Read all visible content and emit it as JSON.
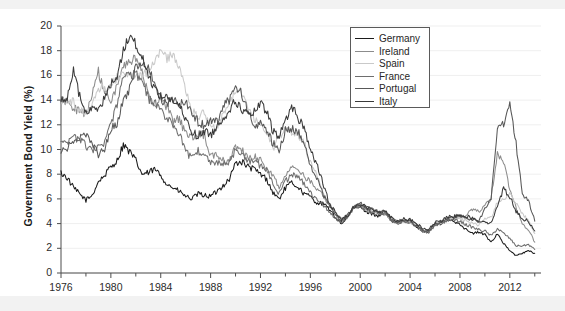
{
  "chart_data": {
    "type": "line",
    "title": "",
    "xlabel": "",
    "ylabel": "Government Bond Yield (%)",
    "xlim": [
      1976,
      2014.5
    ],
    "ylim": [
      0,
      20
    ],
    "ytick_step": 2,
    "xtick_step": 4,
    "xminor_step": 2,
    "grid": "horizontal-faint",
    "legend_position": "top-right-inside",
    "ytick_labels": [
      "0",
      "2",
      "4",
      "6",
      "8",
      "10",
      "12",
      "14",
      "16",
      "18",
      "20"
    ],
    "xtick_labels": [
      "1976",
      "1980",
      "1984",
      "1988",
      "1992",
      "1996",
      "2000",
      "2004",
      "2008",
      "2012"
    ],
    "legend_entries": [
      "Germany",
      "Ireland",
      "Spain",
      "France",
      "Portugal",
      "Italy"
    ],
    "colors": {
      "Germany": "#1b1b1b",
      "Ireland": "#8c8c8c",
      "Spain": "#c9c9c9",
      "France": "#6e6e6e",
      "Portugal": "#585858",
      "Italy": "#3a3a3a"
    },
    "x": [
      1976,
      1976.5,
      1977,
      1977.5,
      1978,
      1978.5,
      1979,
      1979.5,
      1980,
      1980.5,
      1981,
      1981.5,
      1982,
      1982.5,
      1983,
      1983.5,
      1984,
      1984.5,
      1985,
      1985.5,
      1986,
      1986.5,
      1987,
      1987.5,
      1988,
      1988.5,
      1989,
      1989.5,
      1990,
      1990.5,
      1991,
      1991.5,
      1992,
      1992.5,
      1993,
      1993.5,
      1994,
      1994.5,
      1995,
      1995.5,
      1996,
      1996.5,
      1997,
      1997.5,
      1998,
      1998.5,
      1999,
      1999.5,
      2000,
      2000.5,
      2001,
      2001.5,
      2002,
      2002.5,
      2003,
      2003.5,
      2004,
      2004.5,
      2005,
      2005.5,
      2006,
      2006.5,
      2007,
      2007.5,
      2008,
      2008.5,
      2009,
      2009.5,
      2010,
      2010.5,
      2011,
      2011.5,
      2012,
      2012.5,
      2013,
      2013.5,
      2014
    ],
    "series": [
      {
        "name": "Germany",
        "values": [
          8.1,
          7.7,
          6.9,
          6.4,
          5.9,
          6.3,
          7.4,
          7.9,
          8.6,
          9.1,
          10.4,
          9.8,
          9.1,
          8.0,
          8.1,
          8.4,
          7.9,
          7.2,
          6.9,
          6.6,
          6.2,
          6.0,
          6.4,
          6.3,
          6.2,
          6.6,
          7.1,
          7.6,
          8.9,
          9.0,
          8.6,
          8.4,
          8.0,
          7.6,
          6.5,
          6.0,
          6.9,
          7.3,
          7.0,
          6.4,
          6.2,
          5.7,
          5.6,
          5.2,
          4.5,
          4.0,
          4.5,
          5.3,
          5.3,
          5.0,
          4.8,
          4.6,
          4.8,
          4.2,
          4.0,
          4.2,
          4.1,
          3.8,
          3.4,
          3.3,
          3.9,
          4.0,
          4.3,
          4.2,
          4.0,
          3.5,
          3.2,
          3.3,
          3.1,
          2.5,
          3.2,
          2.4,
          1.8,
          1.4,
          1.6,
          1.8,
          1.6
        ]
      },
      {
        "name": "Ireland",
        "values": [
          14.0,
          13.9,
          13.4,
          13.0,
          12.8,
          14.6,
          16.3,
          14.5,
          14.1,
          15.1,
          16.6,
          17.2,
          17.3,
          16.3,
          14.4,
          13.6,
          14.0,
          13.5,
          12.2,
          12.5,
          11.3,
          11.0,
          11.3,
          11.2,
          9.4,
          9.5,
          9.1,
          9.0,
          10.2,
          10.0,
          9.2,
          9.4,
          9.2,
          8.4,
          7.9,
          7.0,
          8.0,
          8.5,
          8.3,
          7.8,
          7.4,
          6.7,
          6.3,
          5.5,
          4.8,
          4.3,
          4.7,
          5.4,
          5.5,
          5.2,
          5.0,
          4.8,
          4.9,
          4.4,
          4.2,
          4.3,
          4.2,
          3.9,
          3.5,
          3.4,
          4.0,
          4.1,
          4.4,
          4.4,
          4.5,
          4.6,
          5.2,
          5.0,
          5.4,
          6.1,
          9.7,
          8.9,
          6.8,
          5.3,
          3.9,
          3.5,
          2.5
        ]
      },
      {
        "name": "Spain",
        "values": [
          13.9,
          14.0,
          13.8,
          13.2,
          13.0,
          13.6,
          14.7,
          15.0,
          15.3,
          15.8,
          16.1,
          16.2,
          16.0,
          15.8,
          16.5,
          17.0,
          18.1,
          17.4,
          17.7,
          16.8,
          14.9,
          13.1,
          12.6,
          13.0,
          11.9,
          11.6,
          13.1,
          13.8,
          14.6,
          14.7,
          13.2,
          12.5,
          12.0,
          11.1,
          10.1,
          10.9,
          11.8,
          11.5,
          11.2,
          10.5,
          9.0,
          7.9,
          6.5,
          5.6,
          4.8,
          4.2,
          4.6,
          5.4,
          5.5,
          5.2,
          5.0,
          4.9,
          4.9,
          4.3,
          4.0,
          4.2,
          4.1,
          3.9,
          3.4,
          3.4,
          3.9,
          4.0,
          4.4,
          4.3,
          4.4,
          4.2,
          4.0,
          3.9,
          4.4,
          4.5,
          5.7,
          5.9,
          6.5,
          5.7,
          4.8,
          4.2,
          3.2
        ]
      },
      {
        "name": "France",
        "values": [
          10.5,
          10.6,
          10.9,
          10.8,
          10.3,
          9.8,
          10.2,
          10.4,
          12.1,
          13.5,
          16.0,
          16.0,
          16.1,
          15.6,
          14.1,
          13.8,
          13.0,
          12.7,
          11.8,
          11.4,
          9.8,
          9.3,
          9.9,
          9.6,
          9.0,
          9.0,
          8.8,
          9.0,
          10.0,
          9.7,
          9.1,
          9.0,
          8.7,
          8.3,
          7.2,
          6.4,
          7.4,
          8.0,
          7.7,
          7.3,
          6.5,
          5.9,
          5.6,
          5.0,
          4.5,
          4.0,
          4.6,
          5.3,
          5.4,
          5.1,
          4.9,
          4.7,
          4.9,
          4.3,
          4.0,
          4.2,
          4.1,
          3.8,
          3.4,
          3.3,
          3.9,
          4.0,
          4.3,
          4.3,
          4.2,
          3.9,
          3.7,
          3.5,
          3.4,
          3.0,
          3.6,
          3.2,
          2.8,
          2.2,
          2.2,
          2.3,
          1.9
        ]
      },
      {
        "name": "Portugal",
        "values": [
          10.0,
          10.1,
          10.6,
          11.0,
          11.1,
          10.5,
          9.6,
          10.0,
          11.6,
          12.2,
          14.0,
          14.9,
          16.7,
          17.1,
          16.6,
          15.5,
          14.0,
          13.8,
          14.0,
          13.7,
          13.9,
          13.1,
          12.2,
          12.0,
          12.4,
          12.2,
          13.5,
          14.0,
          15.1,
          14.5,
          13.0,
          12.0,
          12.2,
          11.5,
          10.5,
          10.0,
          11.5,
          11.7,
          11.5,
          10.3,
          8.8,
          7.7,
          6.4,
          5.5,
          4.8,
          4.2,
          4.7,
          5.4,
          5.6,
          5.3,
          5.1,
          4.9,
          5.0,
          4.4,
          4.1,
          4.3,
          4.2,
          3.9,
          3.5,
          3.4,
          4.0,
          4.1,
          4.4,
          4.5,
          4.6,
          4.5,
          4.3,
          4.2,
          5.2,
          6.0,
          11.5,
          12.0,
          13.9,
          10.5,
          6.5,
          5.8,
          4.2
        ]
      },
      {
        "name": "Italy",
        "values": [
          14.0,
          14.3,
          16.4,
          14.3,
          13.0,
          13.2,
          13.5,
          14.1,
          15.3,
          16.0,
          18.0,
          19.3,
          18.5,
          17.5,
          16.0,
          15.0,
          14.3,
          14.3,
          13.9,
          13.5,
          12.4,
          11.5,
          11.0,
          11.5,
          11.2,
          11.8,
          12.6,
          13.2,
          13.9,
          13.3,
          12.8,
          13.0,
          13.7,
          13.0,
          11.5,
          11.0,
          12.4,
          13.5,
          12.6,
          11.8,
          10.0,
          8.8,
          7.3,
          5.7,
          4.9,
          4.3,
          4.7,
          5.4,
          5.6,
          5.3,
          5.1,
          5.0,
          5.0,
          4.5,
          4.2,
          4.4,
          4.3,
          4.0,
          3.6,
          3.5,
          4.1,
          4.2,
          4.5,
          4.6,
          4.7,
          4.6,
          4.4,
          4.2,
          4.2,
          4.0,
          5.5,
          6.8,
          6.2,
          5.0,
          4.4,
          4.2,
          3.4
        ]
      }
    ]
  },
  "axes": {
    "y_title": "Government Bond Yield (%)"
  }
}
